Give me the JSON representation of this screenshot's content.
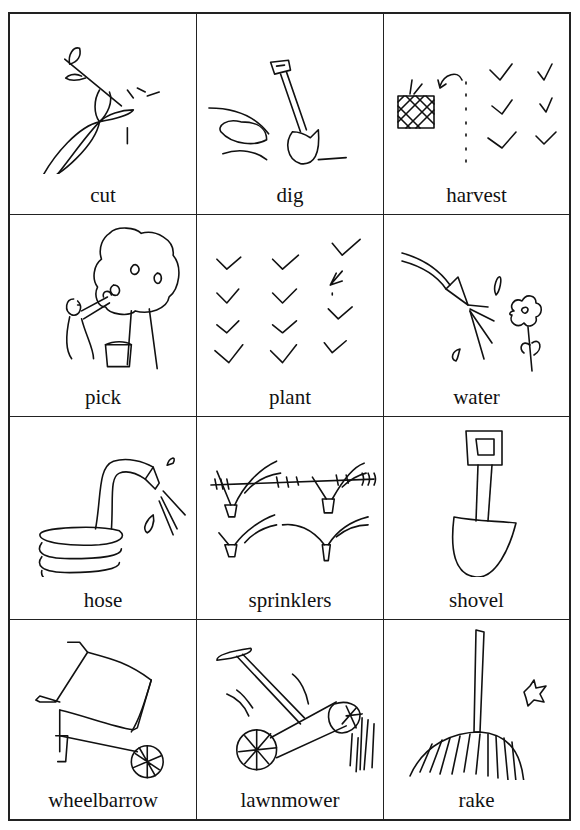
{
  "cards": [
    {
      "label": "cut",
      "icon": "cut-plant-icon"
    },
    {
      "label": "dig",
      "icon": "dig-shovel-icon"
    },
    {
      "label": "harvest",
      "icon": "harvest-basket-icon"
    },
    {
      "label": "pick",
      "icon": "pick-fruit-tree-icon"
    },
    {
      "label": "plant",
      "icon": "plant-seedlings-icon"
    },
    {
      "label": "water",
      "icon": "water-flower-icon"
    },
    {
      "label": "hose",
      "icon": "hose-icon"
    },
    {
      "label": "sprinklers",
      "icon": "sprinklers-icon"
    },
    {
      "label": "shovel",
      "icon": "shovel-icon"
    },
    {
      "label": "wheelbarrow",
      "icon": "wheelbarrow-icon"
    },
    {
      "label": "lawnmower",
      "icon": "lawnmower-icon"
    },
    {
      "label": "rake",
      "icon": "rake-icon"
    }
  ]
}
